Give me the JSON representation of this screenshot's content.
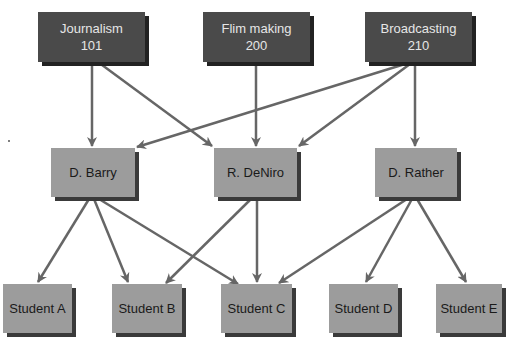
{
  "diagram": {
    "colors": {
      "course_fill": "#4a4a4a",
      "course_text": "#e6e6e6",
      "box_fill": "#9c9c9c",
      "box_text": "#1a1a1a",
      "arrow": "#666666",
      "background": "#ffffff"
    },
    "courses": [
      {
        "id": "journalism",
        "title": "Journalism",
        "number": "101"
      },
      {
        "id": "filmmaking",
        "title": "Flim making",
        "number": "200"
      },
      {
        "id": "broadcasting",
        "title": "Broadcasting",
        "number": "210"
      }
    ],
    "instructors": [
      {
        "id": "barry",
        "name": "D. Barry"
      },
      {
        "id": "deniro",
        "name": "R. DeNiro"
      },
      {
        "id": "rather",
        "name": "D. Rather"
      }
    ],
    "students": [
      {
        "id": "a",
        "name": "Student A"
      },
      {
        "id": "b",
        "name": "Student B"
      },
      {
        "id": "c",
        "name": "Student C"
      },
      {
        "id": "d",
        "name": "Student D"
      },
      {
        "id": "e",
        "name": "Student E"
      }
    ],
    "edges": [
      {
        "from": "Journalism 101",
        "to": "D. Barry"
      },
      {
        "from": "Journalism 101",
        "to": "R. DeNiro"
      },
      {
        "from": "Flim making 200",
        "to": "R. DeNiro"
      },
      {
        "from": "Broadcasting 210",
        "to": "D. Barry"
      },
      {
        "from": "Broadcasting 210",
        "to": "R. DeNiro"
      },
      {
        "from": "Broadcasting 210",
        "to": "D. Rather"
      },
      {
        "from": "D. Barry",
        "to": "Student A"
      },
      {
        "from": "D. Barry",
        "to": "Student B"
      },
      {
        "from": "D. Barry",
        "to": "Student C"
      },
      {
        "from": "R. DeNiro",
        "to": "Student B"
      },
      {
        "from": "R. DeNiro",
        "to": "Student C"
      },
      {
        "from": "D. Rather",
        "to": "Student C"
      },
      {
        "from": "D. Rather",
        "to": "Student D"
      },
      {
        "from": "D. Rather",
        "to": "Student E"
      }
    ]
  }
}
